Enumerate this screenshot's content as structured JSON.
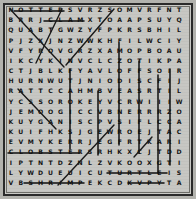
{
  "puzzle": {
    "type": "word-search",
    "title": "Sea Creatures Word Search",
    "rows": 18,
    "cols": 18,
    "background_color": "#c6c6c2",
    "border_color": "#2a2a2a",
    "letter_color": "#141414",
    "mark_color": "#111111",
    "grid": [
      [
        "N",
        "O",
        "T",
        "T",
        "E",
        "R",
        "S",
        "V",
        "R",
        "Z",
        "S",
        "O",
        "M",
        "V",
        "R",
        "F",
        "N",
        "T"
      ],
      [
        "B",
        "R",
        "R",
        "J",
        "C",
        "L",
        "A",
        "M",
        "X",
        "T",
        "O",
        "A",
        "A",
        "P",
        "S",
        "U",
        "Y",
        "Q"
      ],
      [
        "Q",
        "U",
        "A",
        "B",
        "T",
        "G",
        "W",
        "Z",
        "Y",
        "F",
        "P",
        "K",
        "R",
        "S",
        "B",
        "H",
        "I",
        "L"
      ],
      [
        "P",
        "J",
        "Z",
        "X",
        "J",
        "N",
        "Z",
        "W",
        "W",
        "K",
        "H",
        "F",
        "I",
        "L",
        "W",
        "C",
        "I",
        "Y"
      ],
      [
        "V",
        "F",
        "Y",
        "R",
        "O",
        "V",
        "G",
        "R",
        "Z",
        "X",
        "A",
        "M",
        "O",
        "P",
        "B",
        "O",
        "A",
        "U"
      ],
      [
        "I",
        "K",
        "C",
        "Y",
        "K",
        "I",
        "N",
        "V",
        "C",
        "L",
        "C",
        "Z",
        "O",
        "T",
        "I",
        "K",
        "P",
        "A"
      ],
      [
        "C",
        "T",
        "J",
        "B",
        "L",
        "K",
        "F",
        "Y",
        "A",
        "V",
        "L",
        "O",
        "F",
        "F",
        "S",
        "O",
        "I",
        "R"
      ],
      [
        "H",
        "U",
        "R",
        "N",
        "W",
        "U",
        "T",
        "J",
        "N",
        "I",
        "O",
        "D",
        "I",
        "S",
        "C",
        "F",
        "I",
        "J"
      ],
      [
        "R",
        "A",
        "T",
        "T",
        "C",
        "C",
        "A",
        "H",
        "M",
        "B",
        "V",
        "E",
        "A",
        "S",
        "R",
        "T",
        "I",
        "L"
      ],
      [
        "Y",
        "C",
        "S",
        "S",
        "O",
        "R",
        "O",
        "K",
        "E",
        "Y",
        "V",
        "C",
        "R",
        "W",
        "I",
        "I",
        "I",
        "W"
      ],
      [
        "J",
        "E",
        "M",
        "O",
        "O",
        "G",
        "I",
        "C",
        "C",
        "V",
        "B",
        "N",
        "E",
        "R",
        "R",
        "R",
        "Z",
        "O"
      ],
      [
        "K",
        "U",
        "Y",
        "G",
        "A",
        "N",
        "I",
        "S",
        "C",
        "P",
        "V",
        "S",
        "I",
        "F",
        "L",
        "C",
        "C",
        "A"
      ],
      [
        "K",
        "U",
        "I",
        "F",
        "H",
        "K",
        "S",
        "J",
        "G",
        "E",
        "W",
        "R",
        "O",
        "E",
        "J",
        "T",
        "A",
        "C"
      ],
      [
        "E",
        "V",
        "M",
        "Y",
        "K",
        "E",
        "R",
        "R",
        "J",
        "E",
        "G",
        "F",
        "R",
        "T",
        "K",
        "A",
        "R",
        "I"
      ],
      [
        "C",
        "L",
        "O",
        "B",
        "S",
        "T",
        "E",
        "R",
        "S",
        "R",
        "H",
        "K",
        "X",
        "C",
        "J",
        "T",
        "D",
        "D"
      ],
      [
        "I",
        "P",
        "T",
        "N",
        "T",
        "D",
        "Z",
        "N",
        "L",
        "Z",
        "V",
        "K",
        "O",
        "O",
        "X",
        "G",
        "T",
        "I"
      ],
      [
        "L",
        "Y",
        "W",
        "D",
        "U",
        "E",
        "U",
        "I",
        "C",
        "U",
        "T",
        "U",
        "R",
        "T",
        "L",
        "E",
        "I",
        "S"
      ],
      [
        "V",
        "B",
        "S",
        "H",
        "R",
        "I",
        "M",
        "P",
        "E",
        "K",
        "C",
        "D",
        "K",
        "V",
        "P",
        "Y",
        "T",
        "A"
      ]
    ],
    "found_words": [
      {
        "word": "OTTER",
        "direction": "horizontal",
        "row": 0,
        "col": 1,
        "length": 5
      },
      {
        "word": "CLAM",
        "direction": "horizontal",
        "row": 1,
        "col": 4,
        "length": 4
      },
      {
        "word": "LOBSTER",
        "direction": "horizontal",
        "row": 14,
        "col": 1,
        "length": 7
      },
      {
        "word": "TURTLE",
        "direction": "horizontal",
        "row": 16,
        "col": 10,
        "length": 6
      },
      {
        "word": "SHRIMP",
        "direction": "horizontal",
        "row": 17,
        "col": 2,
        "length": 6
      },
      {
        "word": "CRAB",
        "direction": "horizontal",
        "row": 17,
        "col": 12,
        "length": 4
      },
      {
        "word": "EEL",
        "direction": "vertical",
        "row": 4,
        "col": 6,
        "length": 7
      },
      {
        "word": "OCTOPUS",
        "direction": "vertical",
        "row": 3,
        "col": 11,
        "length": 9
      },
      {
        "word": "WHALE",
        "direction": "vertical",
        "row": 5,
        "col": 13,
        "length": 8
      },
      {
        "word": "SEAL",
        "direction": "vertical",
        "row": 7,
        "col": 15,
        "length": 9
      },
      {
        "word": "CORAL",
        "direction": "vertical",
        "row": 6,
        "col": 16,
        "length": 10
      },
      {
        "word": "SQUID",
        "direction": "diagonal-down",
        "row": 0,
        "col": 0,
        "length": 6
      },
      {
        "word": "STARFISH",
        "direction": "diagonal-down",
        "row": 0,
        "col": 4,
        "length": 5
      },
      {
        "word": "SHARK",
        "direction": "diagonal-up",
        "row": 7,
        "col": 4,
        "length": 8
      },
      {
        "word": "SPONGE",
        "direction": "diagonal-down",
        "row": 8,
        "col": 0,
        "length": 4
      },
      {
        "word": "RAY",
        "direction": "diagonal-up",
        "row": 16,
        "col": 6,
        "length": 6
      },
      {
        "word": "FISH",
        "direction": "diagonal-up",
        "row": 14,
        "col": 11,
        "length": 3
      }
    ]
  }
}
